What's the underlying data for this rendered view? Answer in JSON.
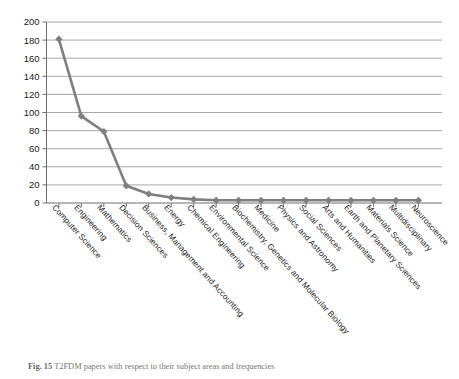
{
  "caption": {
    "label": "Fig. 15",
    "text": "T2FDM papers with respect to their subject areas and frequencies"
  },
  "colors": {
    "series": "#7f7f7f",
    "gridline": "#8c8c8c",
    "axis": "#6e6e6e",
    "text": "#1a1a1a"
  },
  "chart_data": {
    "type": "line",
    "title": "",
    "xlabel": "",
    "ylabel": "",
    "ylim": [
      0,
      200
    ],
    "ytick_step": 20,
    "yticks": [
      "0",
      "20",
      "40",
      "60",
      "80",
      "100",
      "120",
      "140",
      "160",
      "180",
      "200"
    ],
    "grid": "horizontal",
    "legend": "none",
    "marker": "diamond",
    "categories": [
      "Computer Science",
      "Engineering",
      "Mathematics",
      "Decision Sciences",
      "Business, Management and Accounting",
      "Energy",
      "Chemical Engineering",
      "Environmental Science",
      "Biochemistry, Genetics and Molecular Biology",
      "Medicine",
      "Physics and Astronomy",
      "Social Sciences",
      "Arts and Humanities",
      "Earth and Planetary Sciences",
      "Materials Science",
      "Multidisciplinary",
      "Neuroscience"
    ],
    "values": [
      181,
      96,
      79,
      19,
      10,
      6,
      4,
      3,
      3,
      3,
      3,
      3,
      3,
      3,
      3,
      3,
      3
    ]
  }
}
